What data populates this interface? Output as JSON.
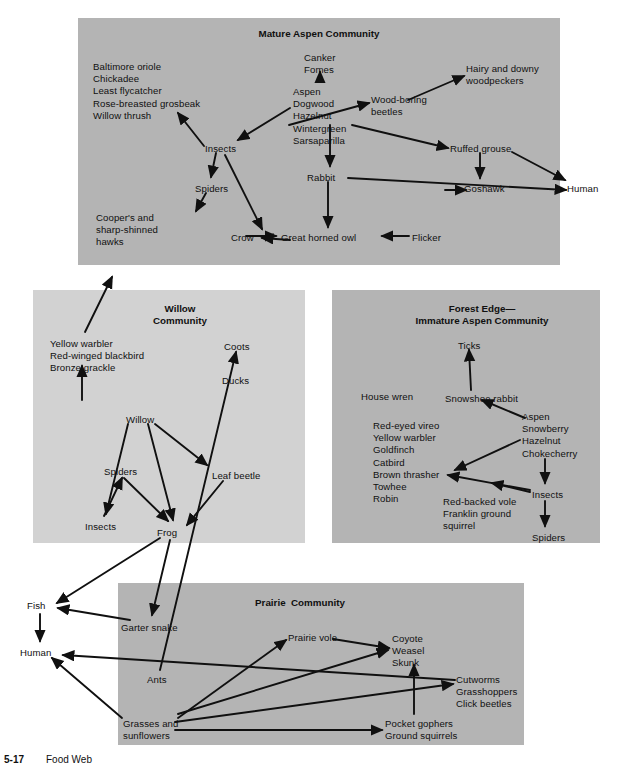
{
  "figure": {
    "caption_number": "5-17",
    "caption_text": "Food Web"
  },
  "colors": {
    "mature_aspen_bg": "#b4b4b4",
    "willow_bg": "#d2d2d2",
    "forest_edge_bg": "#b4b4b4",
    "prairie_bg": "#b4b4b4",
    "page_bg": "#ffffff",
    "ink": "#101010"
  },
  "communities": [
    {
      "id": "mature-aspen",
      "title": "Mature Aspen Community",
      "x": 78,
      "y": 18,
      "w": 482,
      "h": 247,
      "shade": "#b4b4b4"
    },
    {
      "id": "willow",
      "title": "Willow\nCommunity",
      "x": 33,
      "y": 290,
      "w": 272,
      "h": 253,
      "shade": "#d2d2d2"
    },
    {
      "id": "forest-edge",
      "title": "Forest Edge—\nImmature Aspen Community",
      "x": 332,
      "y": 290,
      "w": 268,
      "h": 253,
      "shade": "#b4b4b4"
    },
    {
      "id": "prairie",
      "title": "Prairie  Community",
      "x": 118,
      "y": 583,
      "w": 406,
      "h": 162,
      "shade": "#b4b4b4"
    }
  ],
  "titles": [
    {
      "id": "title-mature-aspen",
      "text": "Mature Aspen Community",
      "x": 205,
      "y": 28,
      "w": 228
    },
    {
      "id": "title-willow",
      "text": "Willow\nCommunity",
      "x": 130,
      "y": 303,
      "w": 100
    },
    {
      "id": "title-forest-edge",
      "text": "Forest Edge—\nImmature Aspen Community",
      "x": 392,
      "y": 303,
      "w": 180
    },
    {
      "id": "title-prairie",
      "text": "Prairie  Community",
      "x": 230,
      "y": 597,
      "w": 140
    }
  ],
  "nodes": [
    {
      "id": "baltimore-group",
      "text": "Baltimore oriole\nChickadee\nLeast flycatcher\nRose-breasted grosbeak\nWillow thrush",
      "x": 93,
      "y": 61,
      "align": "left"
    },
    {
      "id": "canker-fomes",
      "text": "Canker\nFomes",
      "x": 304,
      "y": 52,
      "align": "left"
    },
    {
      "id": "aspen-group-mature",
      "text": "Aspen\nDogwood\nHazelnut\nWintergreen\nSarsaparilla",
      "x": 293,
      "y": 86,
      "align": "left"
    },
    {
      "id": "wood-boring-beetles",
      "text": "Wood-boring\nbeetles",
      "x": 371,
      "y": 94,
      "align": "left"
    },
    {
      "id": "hairy-downy-woodpeckers",
      "text": "Hairy and downy\nwoodpeckers",
      "x": 466,
      "y": 63,
      "align": "left"
    },
    {
      "id": "insects-mature",
      "text": "Insects",
      "x": 205,
      "y": 143,
      "align": "left"
    },
    {
      "id": "spiders-mature",
      "text": "Spiders",
      "x": 195,
      "y": 183,
      "align": "left"
    },
    {
      "id": "rabbit",
      "text": "Rabbit",
      "x": 307,
      "y": 172,
      "align": "left"
    },
    {
      "id": "ruffed-grouse",
      "text": "Ruffed grouse",
      "x": 450,
      "y": 143,
      "align": "left"
    },
    {
      "id": "goshawk",
      "text": "Goshawk",
      "x": 464,
      "y": 183,
      "align": "left"
    },
    {
      "id": "human-top",
      "text": "Human",
      "x": 567,
      "y": 183,
      "align": "left"
    },
    {
      "id": "coopers-hawks",
      "text": "Cooper's and\nsharp-shinned\nhawks",
      "x": 96,
      "y": 212,
      "align": "left"
    },
    {
      "id": "crow",
      "text": "Crow",
      "x": 231,
      "y": 232,
      "align": "left"
    },
    {
      "id": "great-horned-owl",
      "text": "Great horned owl",
      "x": 281,
      "y": 232,
      "align": "left"
    },
    {
      "id": "flicker",
      "text": "Flicker",
      "x": 412,
      "y": 232,
      "align": "left"
    },
    {
      "id": "yellow-warbler-group",
      "text": "Yellow warbler\nRed-winged blackbird\nBronze grackle",
      "x": 50,
      "y": 338,
      "align": "left"
    },
    {
      "id": "coots",
      "text": "Coots",
      "x": 224,
      "y": 341,
      "align": "left"
    },
    {
      "id": "ducks",
      "text": "Ducks",
      "x": 222,
      "y": 375,
      "align": "left"
    },
    {
      "id": "willow-plant",
      "text": "Willow",
      "x": 126,
      "y": 414,
      "align": "left"
    },
    {
      "id": "spiders-willow",
      "text": "Spiders",
      "x": 104,
      "y": 466,
      "align": "left"
    },
    {
      "id": "leaf-beetle",
      "text": "Leaf beetle",
      "x": 212,
      "y": 470,
      "align": "left"
    },
    {
      "id": "insects-willow",
      "text": "Insects",
      "x": 85,
      "y": 521,
      "align": "left"
    },
    {
      "id": "frog",
      "text": "Frog",
      "x": 157,
      "y": 527,
      "align": "left"
    },
    {
      "id": "ticks",
      "text": "Ticks",
      "x": 458,
      "y": 340,
      "align": "left"
    },
    {
      "id": "house-wren",
      "text": "House wren",
      "x": 361,
      "y": 391,
      "align": "left"
    },
    {
      "id": "snowshoe-rabbit",
      "text": "Snowshoe rabbit",
      "x": 445,
      "y": 393,
      "align": "left"
    },
    {
      "id": "aspen-group-edge",
      "text": "Aspen\nSnowberry\nHazelnut\nChokecherry",
      "x": 522,
      "y": 411,
      "align": "left"
    },
    {
      "id": "red-eyed-vireo-group",
      "text": "Red-eyed vireo\nYellow warbler\nGoldfinch\nCatbird\nBrown thrasher\nTowhee\nRobin",
      "x": 373,
      "y": 420,
      "align": "left"
    },
    {
      "id": "insects-edge",
      "text": "Insects",
      "x": 532,
      "y": 489,
      "align": "left"
    },
    {
      "id": "red-backed-vole-group",
      "text": "Red-backed vole\nFranklin ground\nsquirrel",
      "x": 443,
      "y": 496,
      "align": "left"
    },
    {
      "id": "spiders-edge",
      "text": "Spiders",
      "x": 532,
      "y": 532,
      "align": "left"
    },
    {
      "id": "fish",
      "text": "Fish",
      "x": 27,
      "y": 600,
      "align": "left"
    },
    {
      "id": "human-bottom",
      "text": "Human",
      "x": 20,
      "y": 647,
      "align": "left"
    },
    {
      "id": "garter-snake",
      "text": "Garter snake",
      "x": 121,
      "y": 622,
      "align": "left"
    },
    {
      "id": "prairie-vole",
      "text": "Prairie vole",
      "x": 288,
      "y": 632,
      "align": "left"
    },
    {
      "id": "coyote-group",
      "text": "Coyote\nWeasel\nSkunk",
      "x": 392,
      "y": 633,
      "align": "left"
    },
    {
      "id": "ants",
      "text": "Ants",
      "x": 147,
      "y": 674,
      "align": "left"
    },
    {
      "id": "cutworms-group",
      "text": "Cutworms\nGrasshoppers\nClick beetles",
      "x": 456,
      "y": 674,
      "align": "left"
    },
    {
      "id": "grasses-sunflowers",
      "text": "Grasses and\nsunflowers",
      "x": 123,
      "y": 718,
      "align": "left"
    },
    {
      "id": "pocket-gophers-group",
      "text": "Pocket gophers\nGround squirrels",
      "x": 385,
      "y": 718,
      "align": "left"
    }
  ],
  "arrows": [
    {
      "from": "aspen-group-mature",
      "to": "canker-fomes",
      "d": "M320,82 L320,72"
    },
    {
      "from": "aspen-group-mature",
      "to": "insects-mature",
      "d": "M290,108 L238,140"
    },
    {
      "from": "aspen-group-mature",
      "to": "wood-boring-beetles",
      "d": "M289,125 L369,103"
    },
    {
      "from": "aspen-group-mature",
      "to": "rabbit",
      "d": "M330,125 L330,166"
    },
    {
      "from": "aspen-group-mature",
      "to": "ruffed-grouse",
      "d": "M352,125 L448,148"
    },
    {
      "from": "wood-boring-beetles",
      "to": "hairy-downy-woodpeckers",
      "d": "M408,100 L464,76"
    },
    {
      "from": "insects-mature",
      "to": "baltimore-group",
      "d": "M204,146 L178,113"
    },
    {
      "from": "insects-mature",
      "to": "spiders-mature",
      "d": "M216,153 L211,177"
    },
    {
      "from": "insects-mature",
      "to": "crow",
      "d": "M225,155 L262,229"
    },
    {
      "from": "spiders-mature",
      "to": "coopers-hawks",
      "d": "M206,193 L196,211"
    },
    {
      "from": "rabbit",
      "to": "great-horned-owl",
      "d": "M328,182 L328,227"
    },
    {
      "from": "rabbit",
      "to": "human-top",
      "d": "M348,178 L566,190"
    },
    {
      "from": "ruffed-grouse",
      "to": "goshawk",
      "d": "M480,153 L480,178"
    },
    {
      "from": "ruffed-grouse",
      "to": "human-top",
      "d": "M512,152 L565,180"
    },
    {
      "from": "goshawk",
      "to": "human-top",
      "d": "M445,190 L466,190"
    },
    {
      "from": "flicker",
      "to": "great-horned-owl",
      "d": "M409,236 L382,236"
    },
    {
      "from": "crow",
      "to": "great-horned-owl",
      "d": "M246,236 L276,236"
    },
    {
      "from": "yellow-warbler-group",
      "to": "coopers-hawks",
      "d": "M85,332 L112,277"
    },
    {
      "from": "willow-community-ground",
      "to": "yellow-warbler-group",
      "d": "M82,400 L82,366"
    },
    {
      "from": "willow-plant",
      "to": "insects-willow",
      "d": "M128,424 L106,514"
    },
    {
      "from": "willow-plant",
      "to": "leaf-beetle",
      "d": "M155,424 L207,465"
    },
    {
      "from": "willow-plant",
      "to": "frog",
      "d": "M148,424 L173,520"
    },
    {
      "from": "insects-willow",
      "to": "spiders-willow",
      "d": "M104,516 L122,478"
    },
    {
      "from": "spiders-willow",
      "to": "frog",
      "d": "M124,478 L168,521"
    },
    {
      "from": "leaf-beetle",
      "to": "frog",
      "d": "M223,481 L187,525"
    },
    {
      "from": "aspen-group-edge",
      "to": "insects-edge",
      "d": "M545,459 L545,483"
    },
    {
      "from": "insects-edge",
      "to": "spiders-edge",
      "d": "M545,501 L545,526"
    },
    {
      "from": "aspen-group-edge",
      "to": "snowshoe-rabbit",
      "d": "M525,418 L482,400"
    },
    {
      "from": "snowshoe-rabbit",
      "to": "ticks",
      "d": "M471,390 L469,350"
    },
    {
      "from": "aspen-group-edge",
      "to": "red-eyed-vireo-group",
      "d": "M520,440 L455,470"
    },
    {
      "from": "insects-edge",
      "to": "red-eyed-vireo-group",
      "d": "M530,490 L448,475"
    },
    {
      "from": "insects-edge",
      "to": "red-backed-vole-group",
      "d": "M530,492 L492,483"
    },
    {
      "from": "grasses-sunflowers",
      "to": "cutworms-group",
      "d": "M175,722 L453,684"
    },
    {
      "from": "grasses-sunflowers",
      "to": "pocket-gophers-group",
      "d": "M175,730 L382,730"
    },
    {
      "from": "grasses-sunflowers",
      "to": "prairie-vole",
      "d": "M178,718 L286,640"
    },
    {
      "from": "grasses-sunflowers",
      "to": "coyote-group",
      "d": "M178,714 L388,650"
    },
    {
      "from": "prairie-vole",
      "to": "coyote-group",
      "d": "M333,639 L389,648"
    },
    {
      "from": "pocket-gophers-group",
      "to": "coyote-group",
      "d": "M414,714 L414,665"
    },
    {
      "from": "cutworms-group",
      "to": "human-bottom",
      "d": "M455,680 L63,655"
    },
    {
      "from": "garter-snake",
      "to": "fish",
      "d": "M130,620 L58,608"
    },
    {
      "from": "fish",
      "to": "human-bottom",
      "d": "M40,614 L40,641"
    },
    {
      "from": "grasses-sunflowers",
      "to": "human-bottom",
      "d": "M122,718 L52,658"
    },
    {
      "from": "frog",
      "to": "fish",
      "d": "M160,538 L57,603"
    },
    {
      "from": "frog",
      "to": "garter-snake",
      "d": "M170,540 L152,615"
    },
    {
      "from": "ants",
      "to": "coots",
      "d": "M160,670 L236,352"
    },
    {
      "from": "great-horned-owl",
      "to": "crow",
      "d": "M290,240 L262,238"
    }
  ]
}
